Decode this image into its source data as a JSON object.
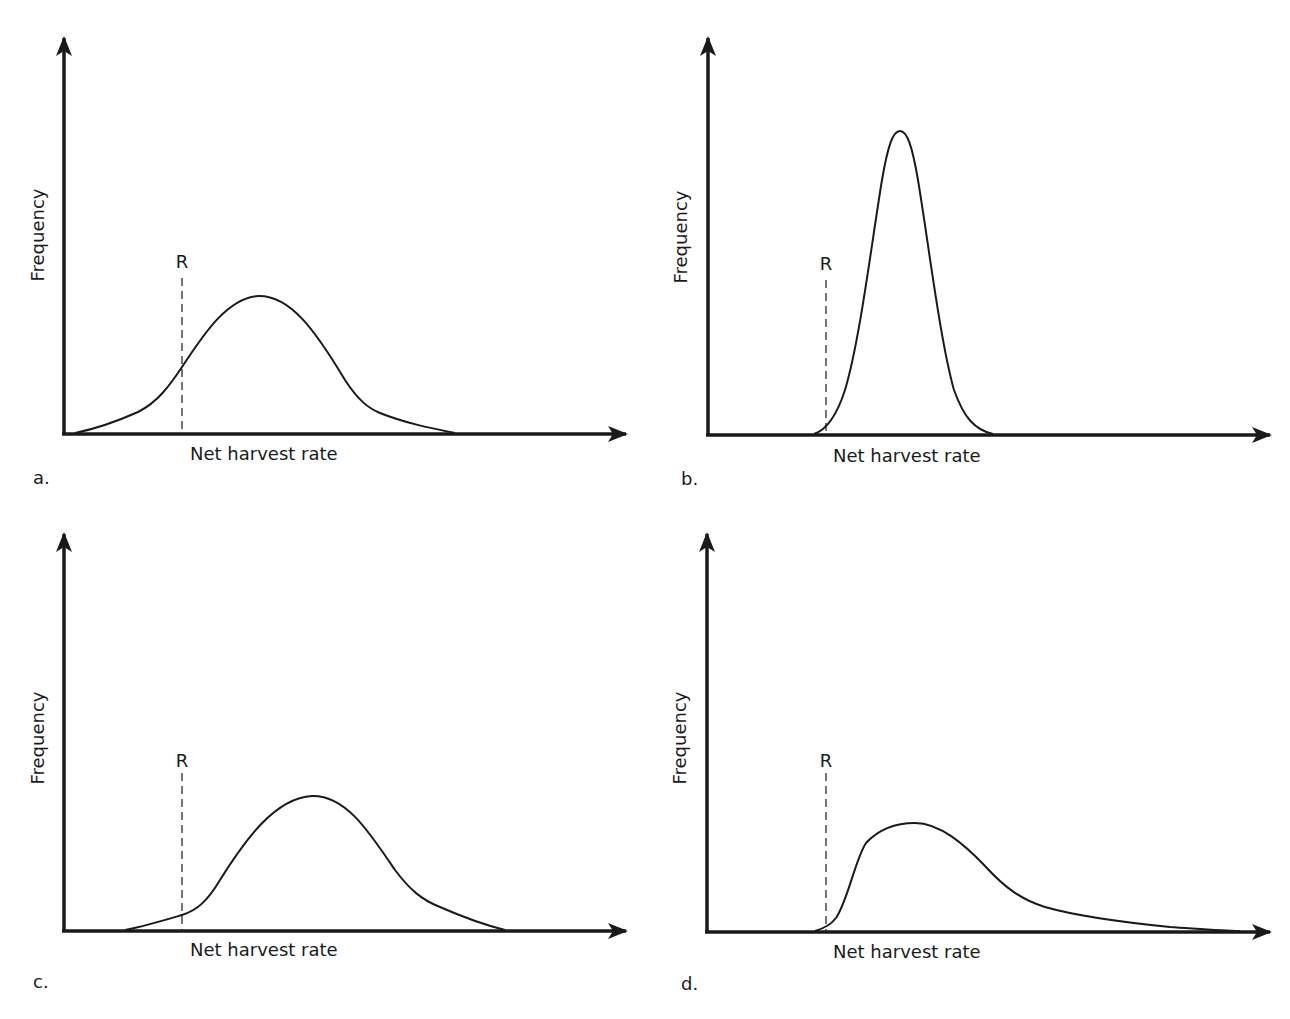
{
  "figure": {
    "panels": [
      {
        "id": "a",
        "panel_label": "a.",
        "x_axis_label": "Net harvest rate",
        "y_axis_label": "Frequency",
        "threshold_label": "R",
        "curve_shape": "broad bell, moderate height, peak slightly right of R, substantial mass left of R"
      },
      {
        "id": "b",
        "panel_label": "b.",
        "x_axis_label": "Net harvest rate",
        "y_axis_label": "Frequency",
        "threshold_label": "R",
        "curve_shape": "narrow tall bell, entirely right of R"
      },
      {
        "id": "c",
        "panel_label": "c.",
        "x_axis_label": "Net harvest rate",
        "y_axis_label": "Frequency",
        "threshold_label": "R",
        "curve_shape": "broad bell shifted right, small tail left of R"
      },
      {
        "id": "d",
        "panel_label": "d.",
        "x_axis_label": "Net harvest rate",
        "y_axis_label": "Frequency",
        "threshold_label": "R",
        "curve_shape": "right-skewed, starts at R, long right tail"
      }
    ]
  },
  "caption": {
    "visible_text": ""
  },
  "colors": {
    "line": "#1a1a1a",
    "background": "#ffffff"
  }
}
